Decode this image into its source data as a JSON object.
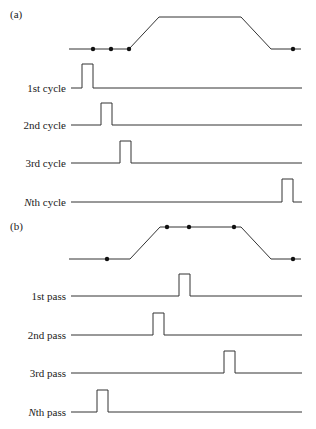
{
  "panels": [
    {
      "id": "a",
      "label": "(a)",
      "label_pos": [
        10,
        18
      ],
      "profile": {
        "points": [
          [
            69,
            49
          ],
          [
            129,
            49
          ],
          [
            159,
            17
          ],
          [
            241,
            17
          ],
          [
            271,
            49
          ],
          [
            301,
            49
          ]
        ],
        "dots": [
          [
            93,
            49
          ],
          [
            111,
            49
          ],
          [
            129,
            49
          ],
          [
            293,
            49
          ]
        ]
      },
      "rows": [
        {
          "label": "1st cycle",
          "y": 88,
          "pulse_x": 82,
          "pulse_w": 11,
          "top": 64
        },
        {
          "label": "2nd cycle",
          "y": 125,
          "pulse_x": 101,
          "pulse_w": 11,
          "top": 103
        },
        {
          "label": "3rd cycle",
          "y": 163,
          "pulse_x": 120,
          "pulse_w": 11,
          "top": 141
        },
        {
          "label": "Nth cycle",
          "italic_prefix": "N",
          "rest": "th cycle",
          "y": 202,
          "pulse_x": 282,
          "pulse_w": 11,
          "top": 179
        }
      ]
    },
    {
      "id": "b",
      "label": "(b)",
      "label_pos": [
        10,
        230
      ],
      "profile": {
        "points": [
          [
            69,
            259
          ],
          [
            130,
            259
          ],
          [
            160,
            227
          ],
          [
            241,
            227
          ],
          [
            271,
            259
          ],
          [
            301,
            259
          ]
        ],
        "dots": [
          [
            107,
            259
          ],
          [
            167,
            227
          ],
          [
            189,
            227
          ],
          [
            234,
            227
          ],
          [
            293,
            259
          ]
        ]
      },
      "rows": [
        {
          "label": "1st pass",
          "y": 296,
          "pulse_x": 179,
          "pulse_w": 11,
          "top": 274
        },
        {
          "label": "2nd pass",
          "y": 335,
          "pulse_x": 153,
          "pulse_w": 11,
          "top": 313
        },
        {
          "label": "3rd pass",
          "y": 373,
          "pulse_x": 224,
          "pulse_w": 11,
          "top": 351
        },
        {
          "label": "Nth pass",
          "italic_prefix": "N",
          "rest": "th pass",
          "y": 412,
          "pulse_x": 97,
          "pulse_w": 11,
          "top": 390
        }
      ]
    }
  ],
  "line_x_start": 71,
  "line_x_end": 302
}
